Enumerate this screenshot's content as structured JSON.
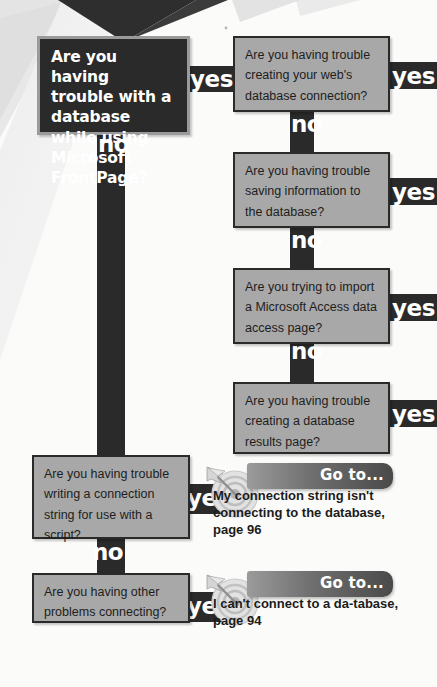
{
  "page": {
    "colors": {
      "dark": "#2b2a2a",
      "gray_box": "#a8a8a8",
      "box_border": "#2b2a2a",
      "text_dark": "#1d1d1d",
      "text_light": "#ffffff",
      "background": "#fbfbfa"
    }
  },
  "labels": {
    "yes": "yes",
    "no": "no",
    "go_to": "Go to..."
  },
  "nodes": {
    "root": {
      "text": "Are you having trouble with a database while using Microsoft FrontPage?",
      "style": "dark"
    },
    "q1": {
      "text": "Are you having trouble creating your web's database connection?"
    },
    "q2": {
      "text": "Are you having trouble saving information to the database?"
    },
    "q3": {
      "text": "Are you trying to import a Microsoft Access data access page?"
    },
    "q4": {
      "text": "Are you having trouble creating a database results page?"
    },
    "q5": {
      "text": "Are you having trouble writing a connection string for use with a script?"
    },
    "q6": {
      "text": "Are you having other problems connecting?"
    }
  },
  "gotos": [
    {
      "banner": "Go to...",
      "body": "My connection string isn't connecting to the database, page 96",
      "icon": "target-bullseye-arrow-icon"
    },
    {
      "banner": "Go to...",
      "body": "I can't connect to a da-tabase, page 94",
      "icon": "target-bullseye-arrow-icon"
    }
  ],
  "edges": {
    "root_yes": "yes",
    "root_no": "no",
    "q1_yes": "yes",
    "q1_no": "no",
    "q2_yes": "yes",
    "q2_no": "no",
    "q3_yes": "yes",
    "q3_no": "no",
    "q4_yes": "yes",
    "q5_yes": "yes",
    "q5_no": "no",
    "q6_yes": "yes"
  }
}
